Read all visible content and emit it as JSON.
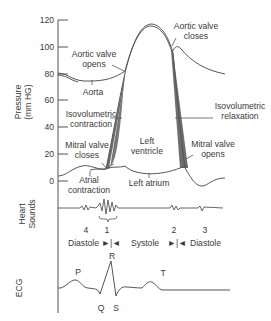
{
  "diagram": {
    "y_axis": {
      "label_line1": "Pressure",
      "label_line2": "(mm HG)",
      "ticks": [
        "120",
        "100",
        "80",
        "60",
        "40",
        "20",
        "0"
      ]
    },
    "pressure_labels": {
      "aortic_valve_opens_1": "Aortic valve",
      "aortic_valve_opens_2": "opens",
      "aortic_valve_closes_1": "Aortic valve",
      "aortic_valve_closes_2": "closes",
      "aorta": "Aorta",
      "isovolumetric_contraction_1": "Isovolumetric",
      "isovolumetric_contraction_2": "contraction",
      "isovolumetric_relaxation_1": "Isovolumetric",
      "isovolumetric_relaxation_2": "relaxation",
      "left_ventricle_1": "Left",
      "left_ventricle_2": "ventricle",
      "mitral_valve_closes_1": "Mitral valve",
      "mitral_valve_closes_2": "closes",
      "mitral_valve_opens_1": "Mitral valve",
      "mitral_valve_opens_2": "opens",
      "atrial_contraction_1": "Atrial",
      "atrial_contraction_2": "contraction",
      "left_atrium": "Left atrium"
    },
    "heart_sounds": {
      "label_line1": "Heart",
      "label_line2": "Sounds",
      "numbers": [
        "4",
        "1",
        "2",
        "3"
      ],
      "phases": {
        "diastole_left": "Diastole",
        "arrows_1": "►|◄",
        "systole": "Systole",
        "arrows_2": "►|◄",
        "diastole_right": "Diastole"
      }
    },
    "ecg": {
      "label": "ECG",
      "waves": [
        "P",
        "Q",
        "R",
        "S",
        "T"
      ]
    },
    "colors": {
      "line": "#555555",
      "shade": "#6e6e6e",
      "text": "#3a3a3a"
    }
  }
}
